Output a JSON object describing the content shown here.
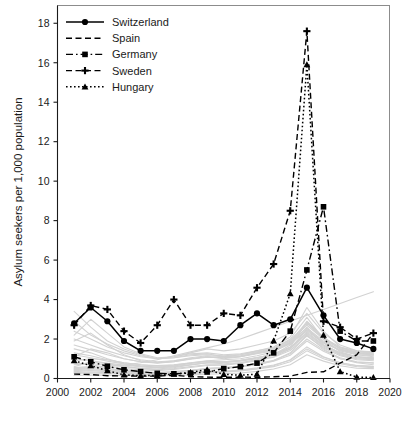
{
  "chart_data": {
    "type": "line",
    "title": "",
    "xlabel": "",
    "ylabel": "Asylum seekers per 1,000 population",
    "xlim": [
      2000,
      2020
    ],
    "ylim": [
      0,
      18.9
    ],
    "xticks": [
      "2000",
      "2002",
      "2004",
      "2006",
      "2008",
      "2010",
      "2012",
      "2014",
      "2016",
      "2018",
      "2020"
    ],
    "yticks": [
      "0",
      "2",
      "4",
      "6",
      "8",
      "10",
      "12",
      "14",
      "16",
      "18"
    ],
    "grid": false,
    "legend_position": "top-left",
    "x": [
      2001,
      2002,
      2003,
      2004,
      2005,
      2006,
      2007,
      2008,
      2009,
      2010,
      2011,
      2012,
      2013,
      2014,
      2015,
      2016,
      2017,
      2018,
      2019
    ],
    "series": [
      {
        "name": "Switzerland",
        "style": "solid",
        "marker": "circle",
        "values": [
          2.8,
          3.6,
          2.9,
          1.9,
          1.4,
          1.4,
          1.4,
          2.0,
          2.0,
          1.9,
          2.7,
          3.3,
          2.7,
          3.0,
          4.6,
          3.2,
          2.0,
          1.8,
          1.5
        ]
      },
      {
        "name": "Spain",
        "style": "dashed",
        "marker": "none",
        "values": [
          0.22,
          0.2,
          0.14,
          0.13,
          0.12,
          0.12,
          0.17,
          0.09,
          0.07,
          0.06,
          0.07,
          0.06,
          0.09,
          0.12,
          0.31,
          0.34,
          0.78,
          1.2,
          2.3
        ]
      },
      {
        "name": "Germany",
        "style": "dash-dot",
        "marker": "square",
        "values": [
          1.1,
          0.85,
          0.62,
          0.44,
          0.35,
          0.26,
          0.24,
          0.27,
          0.33,
          0.5,
          0.6,
          0.78,
          1.3,
          2.4,
          5.5,
          8.7,
          2.4,
          1.9,
          1.9
        ]
      },
      {
        "name": "Sweden",
        "style": "dashed",
        "marker": "plus",
        "values": [
          2.7,
          3.7,
          3.5,
          2.4,
          1.8,
          2.7,
          4.0,
          2.7,
          2.7,
          3.3,
          3.2,
          4.6,
          5.8,
          8.5,
          17.6,
          2.9,
          2.6,
          2.0,
          2.3
        ]
      },
      {
        "name": "Hungary",
        "style": "dotted",
        "marker": "triangle",
        "values": [
          0.9,
          0.65,
          0.4,
          0.18,
          0.15,
          0.16,
          0.22,
          0.31,
          0.45,
          0.21,
          0.17,
          0.22,
          1.9,
          4.3,
          15.9,
          2.2,
          0.35,
          0.07,
          0.05
        ]
      }
    ],
    "background_series_note": "grey unlabelled country trajectories"
  },
  "legend": {
    "items": [
      {
        "label": "Switzerland"
      },
      {
        "label": "Spain"
      },
      {
        "label": "Germany"
      },
      {
        "label": "Sweden"
      },
      {
        "label": "Hungary"
      }
    ]
  },
  "axes": {
    "y_title": "Asylum seekers per 1,000 population",
    "y_tick_labels": [
      "18",
      "16",
      "14",
      "12",
      "10",
      "8",
      "6",
      "4",
      "2",
      "0"
    ],
    "x_tick_labels": [
      "2000",
      "2002",
      "2004",
      "2006",
      "2008",
      "2010",
      "2012",
      "2014",
      "2016",
      "2018",
      "2020"
    ]
  },
  "colors": {
    "foreground": "#000000",
    "background_lines": "#d2d2d2",
    "frame": "#8c8c8c",
    "page": "#ffffff"
  }
}
